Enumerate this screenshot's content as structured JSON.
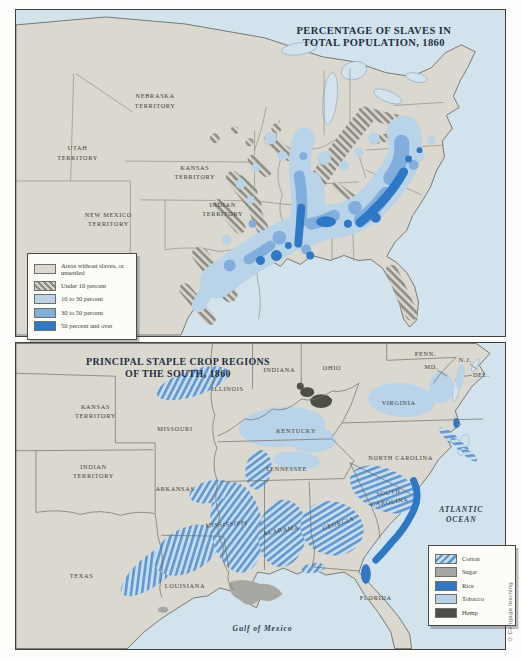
{
  "credit": "© Cengage learning",
  "top_map": {
    "title_line1": "PERCENTAGE OF SLAVES IN",
    "title_line2": "TOTAL POPULATION, 1860",
    "labels": [
      {
        "id": "nebraska-territory",
        "lines": [
          "NEBRASKA",
          "TERRITORY"
        ]
      },
      {
        "id": "utah-territory",
        "lines": [
          "UTAH",
          "TERRITORY"
        ]
      },
      {
        "id": "kansas-territory",
        "lines": [
          "KANSAS",
          "TERRITORY"
        ]
      },
      {
        "id": "new-mexico-territory",
        "lines": [
          "NEW MEXICO",
          "TERRITORY"
        ]
      },
      {
        "id": "indian-territory",
        "lines": [
          "INDIAN",
          "TERRITORY"
        ]
      }
    ],
    "legend": [
      {
        "id": "no-slaves",
        "label": "Areas without slaves, or unsettled",
        "swatch": "plain"
      },
      {
        "id": "under-10",
        "label": "Under 10 percent",
        "swatch": "hatch"
      },
      {
        "id": "10-30",
        "label": "10 to 30 percent",
        "swatch": "light-blue"
      },
      {
        "id": "30-50",
        "label": "30 to 50 percent",
        "swatch": "medium-blue"
      },
      {
        "id": "50-over",
        "label": "50 percent and over",
        "swatch": "dark-blue"
      }
    ],
    "colors": {
      "water": "#d2e3ee",
      "land": "#dbd8cf",
      "light_blue": "#b9d3e8",
      "medium_blue": "#82aedd",
      "dark_blue": "#2f78c6"
    }
  },
  "bottom_map": {
    "title_line1": "PRINCIPAL STAPLE CROP REGIONS",
    "title_line2": "OF THE SOUTH, 1860",
    "labels": [
      {
        "id": "kansas-territory",
        "lines": [
          "KANSAS",
          "TERRITORY"
        ]
      },
      {
        "id": "missouri",
        "lines": [
          "MISSOURI"
        ]
      },
      {
        "id": "illinois",
        "lines": [
          "ILLINOIS"
        ]
      },
      {
        "id": "indiana",
        "lines": [
          "INDIANA"
        ]
      },
      {
        "id": "ohio",
        "lines": [
          "OHIO"
        ]
      },
      {
        "id": "penn",
        "lines": [
          "PENN."
        ]
      },
      {
        "id": "nj",
        "lines": [
          "N.J."
        ]
      },
      {
        "id": "md",
        "lines": [
          "MD."
        ]
      },
      {
        "id": "del",
        "lines": [
          "DEL."
        ]
      },
      {
        "id": "virginia",
        "lines": [
          "VIRGINIA"
        ]
      },
      {
        "id": "kentucky",
        "lines": [
          "KENTUCKY"
        ]
      },
      {
        "id": "tennessee",
        "lines": [
          "TENNESSEE"
        ]
      },
      {
        "id": "north-carolina",
        "lines": [
          "NORTH CAROLINA"
        ]
      },
      {
        "id": "south-carolina",
        "lines": [
          "SOUTH",
          "CAROLINA"
        ]
      },
      {
        "id": "georgia",
        "lines": [
          "GEORGIA"
        ]
      },
      {
        "id": "alabama",
        "lines": [
          "ALABAMA"
        ]
      },
      {
        "id": "mississippi",
        "lines": [
          "MISSISSIPPI"
        ]
      },
      {
        "id": "arkansas",
        "lines": [
          "ARKANSAS"
        ]
      },
      {
        "id": "louisiana",
        "lines": [
          "LOUISIANA"
        ]
      },
      {
        "id": "texas",
        "lines": [
          "TEXAS"
        ]
      },
      {
        "id": "indian-territory",
        "lines": [
          "INDIAN",
          "TERRITORY"
        ]
      },
      {
        "id": "florida",
        "lines": [
          "FLORIDA"
        ]
      },
      {
        "id": "atlantic-ocean",
        "lines": [
          "ATLANTIC",
          "OCEAN"
        ]
      },
      {
        "id": "gulf-of-mexico",
        "lines": [
          "Gulf of Mexico"
        ]
      }
    ],
    "legend": [
      {
        "id": "cotton",
        "label": "Cotton",
        "swatch": "cotton"
      },
      {
        "id": "sugar",
        "label": "Sugar",
        "swatch": "sugar"
      },
      {
        "id": "rice",
        "label": "Rice",
        "swatch": "rice"
      },
      {
        "id": "tobacco",
        "label": "Tobacco",
        "swatch": "tobacco"
      },
      {
        "id": "hemp",
        "label": "Hemp",
        "swatch": "hemp"
      }
    ],
    "colors": {
      "cotton_stripe": "#5f97cf",
      "sugar": "#a9a7a2",
      "rice": "#2f78c6",
      "tobacco": "#b9d3e8",
      "hemp": "#4e4e48"
    }
  }
}
